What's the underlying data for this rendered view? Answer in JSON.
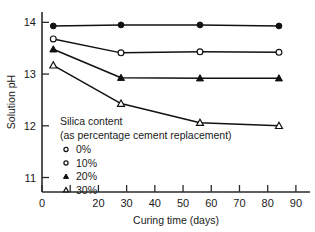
{
  "chart_data": {
    "type": "line",
    "title": "",
    "xlabel": "Curing time (days)",
    "ylabel": "Solution pH",
    "xlim": [
      0,
      95
    ],
    "ylim": [
      10.72,
      14.2
    ],
    "grid": false,
    "legend_position": "inside-lower-left",
    "x_ticks": [
      {
        "value": 0,
        "label": "0"
      },
      {
        "value": 10,
        "label": ""
      },
      {
        "value": 20,
        "label": "20"
      },
      {
        "value": 30,
        "label": "30"
      },
      {
        "value": 40,
        "label": "40"
      },
      {
        "value": 50,
        "label": "50"
      },
      {
        "value": 60,
        "label": "60"
      },
      {
        "value": 70,
        "label": "70"
      },
      {
        "value": 80,
        "label": "80"
      },
      {
        "value": 90,
        "label": "90"
      }
    ],
    "y_ticks": [
      {
        "value": 11,
        "label": "11"
      },
      {
        "value": 12,
        "label": "12"
      },
      {
        "value": 13,
        "label": "13"
      },
      {
        "value": 14,
        "label": "14"
      }
    ],
    "x": [
      4,
      28,
      56,
      84
    ],
    "series": [
      {
        "name": "0%",
        "marker": "filled-circle",
        "values": [
          13.93,
          13.95,
          13.95,
          13.93
        ]
      },
      {
        "name": "10%",
        "marker": "open-circle",
        "values": [
          13.68,
          13.41,
          13.43,
          13.42
        ]
      },
      {
        "name": "20%",
        "marker": "filled-triangle",
        "values": [
          13.48,
          12.93,
          12.92,
          12.92
        ]
      },
      {
        "name": "30%",
        "marker": "open-triangle",
        "values": [
          13.17,
          12.43,
          12.06,
          12.0
        ]
      }
    ],
    "legend": {
      "title_line1": "Silica content",
      "title_line2": "(as percentage cement replacement)",
      "entries": [
        {
          "label": "0%",
          "marker": "open-circle"
        },
        {
          "label": "10%",
          "marker": "open-circle"
        },
        {
          "label": "20%",
          "marker": "filled-triangle"
        },
        {
          "label": "30%",
          "marker": "open-triangle"
        }
      ]
    }
  }
}
